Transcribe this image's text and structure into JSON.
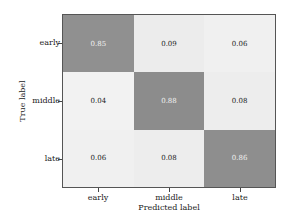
{
  "chart_data": {
    "type": "heatmap",
    "title": "",
    "xlabel": "Predicted label",
    "ylabel": "True label",
    "x_categories": [
      "early",
      "middle",
      "late"
    ],
    "y_categories": [
      "early",
      "middle",
      "late"
    ],
    "values": [
      [
        0.85,
        0.09,
        0.06
      ],
      [
        0.04,
        0.88,
        0.08
      ],
      [
        0.06,
        0.08,
        0.86
      ]
    ],
    "value_labels": [
      [
        "0.85",
        "0.09",
        "0.06"
      ],
      [
        "0.04",
        "0.88",
        "0.08"
      ],
      [
        "0.06",
        "0.08",
        "0.86"
      ]
    ],
    "colormap": {
      "low": "#f7f7f7",
      "high": "#8c8c8c"
    },
    "text_colors": {
      "on_dark": "#f0f0f0",
      "on_light": "#222222"
    },
    "grid": false,
    "legend": "none"
  }
}
